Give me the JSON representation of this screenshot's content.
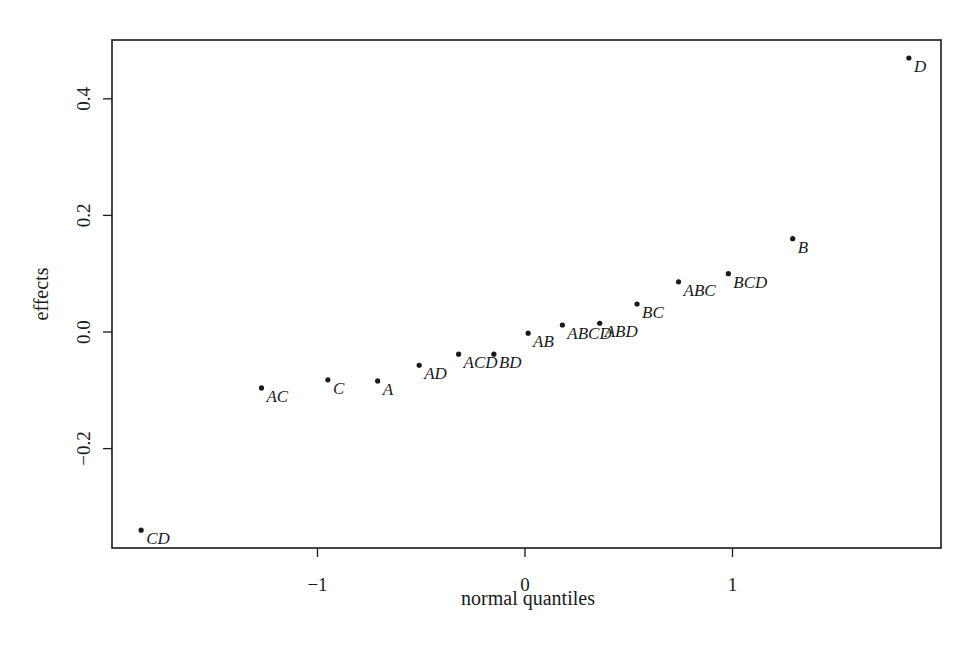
{
  "chart_data": {
    "type": "scatter",
    "title": "",
    "xlabel": "normal quantiles",
    "ylabel": "effects",
    "xlim": [
      -1.9,
      2.0
    ],
    "ylim": [
      -0.375,
      0.5
    ],
    "xticks": [
      -1,
      0,
      1
    ],
    "xtick_labels": [
      "−1",
      "0",
      "1"
    ],
    "yticks": [
      -0.2,
      0.0,
      0.2,
      0.4
    ],
    "ytick_labels": [
      "−0.2",
      "0.0",
      "0.2",
      "0.4"
    ],
    "grid": false,
    "legend": "none",
    "points": [
      {
        "label": "CD",
        "x": -1.85,
        "y": -0.34
      },
      {
        "label": "AC",
        "x": -1.27,
        "y": -0.096
      },
      {
        "label": "C",
        "x": -0.95,
        "y": -0.082
      },
      {
        "label": "A",
        "x": -0.71,
        "y": -0.084
      },
      {
        "label": "AD",
        "x": -0.51,
        "y": -0.057
      },
      {
        "label": "ACD",
        "x": -0.32,
        "y": -0.038
      },
      {
        "label": "BD",
        "x": -0.15,
        "y": -0.038
      },
      {
        "label": "AB",
        "x": 0.015,
        "y": -0.002
      },
      {
        "label": "ABCD",
        "x": 0.18,
        "y": 0.012
      },
      {
        "label": "ABD",
        "x": 0.36,
        "y": 0.015
      },
      {
        "label": "BC",
        "x": 0.54,
        "y": 0.048
      },
      {
        "label": "ABC",
        "x": 0.74,
        "y": 0.086
      },
      {
        "label": "BCD",
        "x": 0.98,
        "y": 0.1
      },
      {
        "label": "B",
        "x": 1.29,
        "y": 0.16
      },
      {
        "label": "D",
        "x": 1.85,
        "y": 0.47
      }
    ],
    "colors": {
      "ink": "#1a1a1a",
      "background": "#ffffff"
    }
  }
}
